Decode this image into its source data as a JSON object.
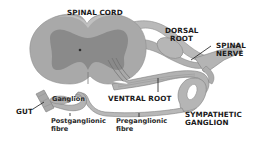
{
  "diagram": {
    "type": "anatomical-illustration",
    "colors": {
      "background": "#ffffff",
      "white_matter": "#a9a9a9",
      "grey_matter": "#8a8a8a",
      "nerve": "#b4b4b4",
      "nerve_stroke": "#7f7f7f",
      "text": "#1a1a1a",
      "leader_line": "#1a1a1a"
    },
    "labels": {
      "spinal_cord": "SPINAL CORD",
      "dorsal_root_line1": "DORSAL",
      "dorsal_root_line2": "ROOT",
      "spinal_nerve_line1": "SPINAL",
      "spinal_nerve_line2": "NERVE",
      "ventral_root": "VENTRAL ROOT",
      "sympathetic_ganglion_line1": "SYMPATHETIC",
      "sympathetic_ganglion_line2": "GANGLION",
      "gut": "GUT",
      "ganglion": "Ganglion",
      "postganglionic_line1": "Postganglionic",
      "postganglionic_line2": "fibre",
      "preganglionic_line1": "Preganglionic",
      "preganglionic_line2": "fibre"
    }
  }
}
